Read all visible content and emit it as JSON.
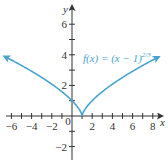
{
  "chart_data": {
    "type": "line",
    "title": "",
    "function_label": "f(x) = (x − 1)",
    "function_exponent": "2/3",
    "xlabel": "x",
    "ylabel": "y",
    "xlim": [
      -7,
      9
    ],
    "ylim": [
      -3,
      7
    ],
    "x_ticks": [
      -6,
      -4,
      -2,
      0,
      2,
      4,
      6,
      8
    ],
    "y_ticks": [
      -2,
      2,
      4,
      6
    ],
    "x_tick_labels": [
      "−6",
      "−4",
      "−2",
      "0",
      "2",
      "4",
      "6",
      "8"
    ],
    "y_tick_labels": [
      "−2",
      "2",
      "4",
      "6"
    ],
    "grid": false,
    "series": [
      {
        "name": "f(x) = (x − 1)^(2/3)",
        "color": "#4aa3cf",
        "x": [
          -7,
          -6,
          -5,
          -4,
          -3,
          -2,
          -1,
          0,
          0.5,
          1,
          1.5,
          2,
          3,
          4,
          5,
          6,
          7,
          8,
          9
        ],
        "y": [
          4.0,
          3.66,
          3.3,
          2.92,
          2.52,
          2.08,
          1.59,
          1.0,
          0.63,
          0,
          0.63,
          1.0,
          1.59,
          2.08,
          2.52,
          2.92,
          3.3,
          3.66,
          4.0
        ]
      }
    ]
  }
}
